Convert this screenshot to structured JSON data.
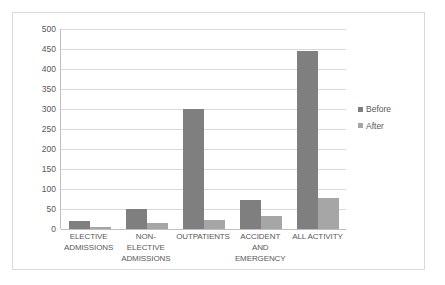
{
  "chart_data": {
    "type": "bar",
    "title": "",
    "xlabel": "",
    "ylabel": "",
    "ylim": [
      0,
      500
    ],
    "ytick_step": 50,
    "yticks": [
      500,
      450,
      400,
      350,
      300,
      250,
      200,
      150,
      100,
      50,
      0
    ],
    "grid": true,
    "legend_position": "right",
    "categories": [
      "ELECTIVE ADMISSIONS",
      "NON-ELECTIVE ADMISSIONS",
      "OUTPATIENTS",
      "ACCIDENT AND EMERGENCY",
      "ALL ACTIVITY"
    ],
    "category_lines": [
      [
        "ELECTIVE",
        "ADMISSIONS"
      ],
      [
        "NON-ELECTIVE",
        "ADMISSIONS"
      ],
      [
        "OUTPATIENTS"
      ],
      [
        "ACCIDENT AND",
        "EMERGENCY"
      ],
      [
        "ALL ACTIVITY"
      ]
    ],
    "series": [
      {
        "name": "Before",
        "color": "#7f7f7f",
        "values": [
          21,
          50,
          300,
          73,
          445
        ]
      },
      {
        "name": "After",
        "color": "#a6a6a6",
        "values": [
          5,
          16,
          23,
          33,
          77
        ]
      }
    ]
  },
  "legend": {
    "items": [
      {
        "label": "Before"
      },
      {
        "label": "After"
      }
    ]
  },
  "colors": {
    "before": "#7f7f7f",
    "after": "#a6a6a6",
    "gridline": "#d9d9d9",
    "axis": "#bfbfbf",
    "text": "#595959",
    "border": "#d9d9d9",
    "background": "#ffffff"
  }
}
